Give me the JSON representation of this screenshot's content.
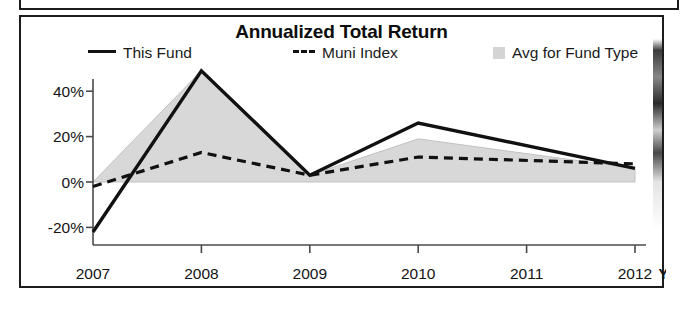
{
  "chart_data": {
    "type": "line",
    "title": "Annualized Total Return",
    "xlabel": "",
    "ylabel": "",
    "categories": [
      "2007",
      "2008",
      "2009",
      "2010",
      "2011",
      "2012"
    ],
    "x_tick_labels": [
      "2007",
      "2008",
      "2009",
      "2010",
      "2011",
      "2012"
    ],
    "x_axis_suffix": "YTD",
    "y_tick_labels": [
      "40%",
      "20%",
      "0%",
      "-20%"
    ],
    "y_tick_values": [
      40,
      20,
      0,
      -20
    ],
    "ylim": [
      -26,
      52
    ],
    "grid": false,
    "legend_position": "top",
    "series": [
      {
        "name": "This Fund",
        "style": "solid-line",
        "color": "#111111",
        "x": [
          "2007",
          "2008",
          "2009",
          "2010",
          "2012"
        ],
        "values": [
          -22,
          49,
          3,
          26,
          6
        ]
      },
      {
        "name": "Muni Index",
        "style": "dashed-line",
        "color": "#111111",
        "x": [
          "2007",
          "2008",
          "2009",
          "2010",
          "2012"
        ],
        "values": [
          -2,
          13,
          3,
          11,
          8
        ]
      },
      {
        "name": "Avg for Fund Type",
        "style": "filled-area",
        "color": "#d8d8d8",
        "x": [
          "2007",
          "2008",
          "2009",
          "2010",
          "2012"
        ],
        "values": [
          0,
          49,
          3,
          19,
          6
        ]
      }
    ]
  },
  "legend": {
    "this_fund": "This Fund",
    "muni_index": "Muni Index",
    "avg_fund_type": "Avg for Fund Type"
  },
  "axis": {
    "y": {
      "t40": "40%",
      "t20": "20%",
      "t0": "0%",
      "tm20": "-20%"
    },
    "x": {
      "y2007": "2007",
      "y2008": "2008",
      "y2009": "2009",
      "y2010": "2010",
      "y2011": "2011",
      "y2012": "2012",
      "ytd": "YTD"
    }
  }
}
